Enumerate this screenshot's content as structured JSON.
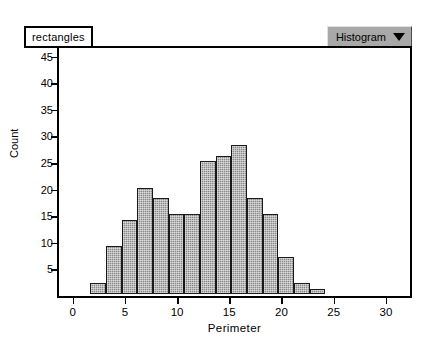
{
  "window": {
    "dataset_tab_label": "rectangles",
    "plot_type_menu": {
      "label": "Histogram",
      "caret_icon": "chevron-down-icon"
    }
  },
  "colors": {
    "bar_fill": "#8a8a8a",
    "bar_outline": "#1a1a1a",
    "axis": "#000000",
    "plot_background": "#ffffff",
    "menu_background": "#a8a8a8"
  },
  "chart_data": {
    "type": "bar",
    "title": "",
    "subtitle": "",
    "xlabel": "Perimeter",
    "ylabel": "Count",
    "xlim": [
      -1.5,
      32.5
    ],
    "ylim": [
      0,
      47
    ],
    "xticks": [
      0,
      5,
      10,
      15,
      20,
      25,
      30
    ],
    "xtick_labels": [
      "0",
      "5",
      "10",
      "15",
      "20",
      "25",
      "30"
    ],
    "yticks": [
      5,
      10,
      15,
      20,
      25,
      30,
      35,
      40,
      45
    ],
    "ytick_labels": [
      "5",
      "10",
      "15",
      "20",
      "25",
      "30",
      "35",
      "40",
      "45"
    ],
    "grid": false,
    "legend": null,
    "bin_width": 1.5,
    "bins": [
      {
        "x0": 1.5,
        "x1": 3.0,
        "value": 2
      },
      {
        "x0": 3.0,
        "x1": 4.5,
        "value": 9
      },
      {
        "x0": 4.5,
        "x1": 6.0,
        "value": 14
      },
      {
        "x0": 6.0,
        "x1": 7.5,
        "value": 20
      },
      {
        "x0": 7.5,
        "x1": 9.0,
        "value": 18
      },
      {
        "x0": 9.0,
        "x1": 10.5,
        "value": 15
      },
      {
        "x0": 10.5,
        "x1": 12.0,
        "value": 15
      },
      {
        "x0": 12.0,
        "x1": 13.5,
        "value": 25
      },
      {
        "x0": 13.5,
        "x1": 15.0,
        "value": 26
      },
      {
        "x0": 15.0,
        "x1": 16.5,
        "value": 28
      },
      {
        "x0": 16.5,
        "x1": 18.0,
        "value": 18
      },
      {
        "x0": 18.0,
        "x1": 19.5,
        "value": 15
      },
      {
        "x0": 19.5,
        "x1": 21.0,
        "value": 7
      },
      {
        "x0": 21.0,
        "x1": 22.5,
        "value": 2
      },
      {
        "x0": 22.5,
        "x1": 24.0,
        "value": 1
      }
    ],
    "categories": [
      "1.5-3",
      "3-4.5",
      "4.5-6",
      "6-7.5",
      "7.5-9",
      "9-10.5",
      "10.5-12",
      "12-13.5",
      "13.5-15",
      "15-16.5",
      "16.5-18",
      "18-19.5",
      "19.5-21",
      "21-22.5",
      "22.5-24"
    ],
    "values": [
      2,
      9,
      14,
      20,
      18,
      15,
      15,
      25,
      26,
      28,
      18,
      15,
      7,
      2,
      1
    ]
  }
}
